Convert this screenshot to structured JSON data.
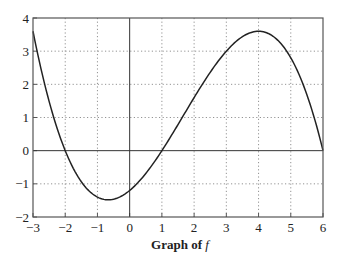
{
  "chart_data": {
    "type": "line",
    "title": "Graph of f",
    "title_prefix": "Graph of ",
    "title_var": "f",
    "xlabel": "",
    "ylabel": "",
    "xlim": [
      -3,
      6
    ],
    "ylim": [
      -2,
      4
    ],
    "grid": true,
    "x_ticks": [
      -3,
      -2,
      -1,
      0,
      1,
      2,
      3,
      4,
      5,
      6
    ],
    "x_tick_labels": [
      "−3",
      "−2",
      "−1",
      "0",
      "1",
      "2",
      "3",
      "4",
      "5",
      "6"
    ],
    "y_ticks": [
      -2,
      -1,
      0,
      1,
      2,
      3,
      4
    ],
    "y_tick_labels": [
      "−2",
      "−1",
      "0",
      "1",
      "2",
      "3",
      "4"
    ],
    "series": [
      {
        "name": "f",
        "formula": "-0.1*(x+2)*(x-1)*(x-6)",
        "x": [
          -3,
          -2.5,
          -2,
          -1.5,
          -1,
          -0.7,
          -0.5,
          0,
          0.5,
          1,
          1.5,
          2,
          2.5,
          3,
          3.5,
          4,
          4.5,
          5,
          5.5,
          6
        ],
        "y": [
          3.6,
          1.24,
          0,
          -0.52,
          -1.4,
          -1.5,
          -1.46,
          -1.2,
          -0.69,
          0,
          0.79,
          1.6,
          2.36,
          3.0,
          3.44,
          3.6,
          3.41,
          2.8,
          1.69,
          0
        ]
      }
    ],
    "reference_lines": {
      "x_axis": 0,
      "y_axis": 0
    }
  }
}
